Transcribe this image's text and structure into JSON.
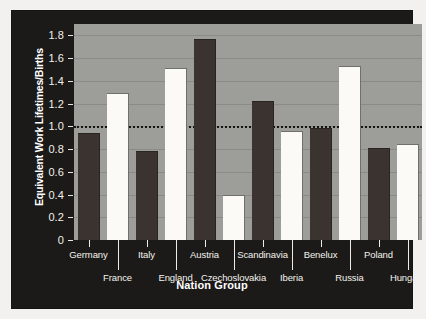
{
  "chart_data": {
    "type": "bar",
    "title": "",
    "xlabel": "Nation Group",
    "ylabel": "Equivalent Work Lifetimes/Births",
    "ylim": [
      0,
      1.9
    ],
    "ytick_labels": [
      "1.8",
      "1.6",
      "1.4",
      "1.2",
      "1.0",
      "0.8",
      "0.6",
      "0.4",
      "0.2",
      "0"
    ],
    "ytick_values": [
      1.8,
      1.6,
      1.4,
      1.2,
      1.0,
      0.8,
      0.6,
      0.4,
      0.2,
      0
    ],
    "grid": true,
    "legend": "none",
    "reference_line": {
      "value": 1.0,
      "style": "dotted",
      "color": "#16150f"
    },
    "categories": [
      "Germany",
      "France",
      "Italy",
      "England",
      "Austria",
      "Czechoslovakia",
      "Scandinavia",
      "Iberia",
      "Benelux",
      "Russia",
      "Poland",
      "Hungary"
    ],
    "bar_styles": [
      "dark",
      "light",
      "dark",
      "light",
      "dark",
      "light",
      "dark",
      "light",
      "dark",
      "light",
      "dark",
      "light"
    ],
    "values": [
      0.93,
      1.28,
      0.77,
      1.5,
      1.76,
      0.39,
      1.21,
      0.95,
      0.98,
      1.52,
      0.8,
      0.84
    ],
    "label_rows": [
      "top",
      "bottom",
      "top",
      "bottom",
      "top",
      "bottom",
      "top",
      "bottom",
      "top",
      "bottom",
      "top",
      "bottom"
    ],
    "colors": {
      "dark_bar": "#3a332f",
      "light_bar": "#fbfaf6",
      "plot_background": "#9d9d9a",
      "panel_background": "#1b1a18",
      "figure_background": "#f2f1ef",
      "gridline": "#8a8a87",
      "axis_text": "#f4f2ed"
    }
  }
}
